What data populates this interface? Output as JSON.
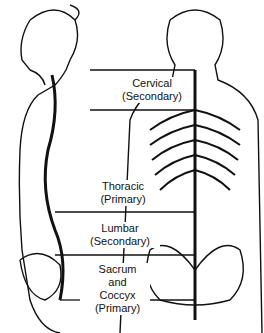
{
  "diagram": {
    "labels": [
      {
        "line1": "Cervical",
        "line2": "(Secondary)"
      },
      {
        "line1": "Thoracic",
        "line2": "(Primary)"
      },
      {
        "line1": "Lumbar",
        "line2": "(Secondary)"
      },
      {
        "line1": "Sacrum",
        "line2": "and",
        "line3": "Coccyx",
        "line4": "(Primary)"
      }
    ]
  }
}
